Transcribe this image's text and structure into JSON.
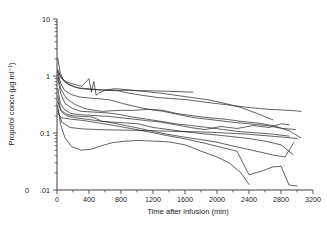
{
  "figure": {
    "background": "#ffffff",
    "line_color": "#262626",
    "axis_color": "#2b2b2b"
  },
  "chart_data": {
    "type": "line",
    "title": "",
    "subtitle": "",
    "xlabel": "Time after infusion (min)",
    "ylabel": "Propofol concn (µg ml⁻¹)",
    "xlim": [
      0,
      3200
    ],
    "ylim": [
      0.01,
      10
    ],
    "yscale": "log",
    "xscale": "linear",
    "grid": false,
    "legend": "none",
    "xticks": [
      0,
      400,
      800,
      1200,
      1600,
      2000,
      2400,
      2800,
      3200
    ],
    "xtick_labels": [
      "0",
      "400",
      "800",
      "1200",
      "1600",
      "2000",
      "2400",
      "2800",
      "3200"
    ],
    "x_minor_tick_interval": 200,
    "yticks": [
      0.01,
      0.1,
      1,
      10
    ],
    "ytick_labels": [
      ".01",
      "0.1",
      "1",
      "10"
    ],
    "axis_break_label": "0",
    "annotations": [
      "Axis break marker '0' shown left of the .01 tick on the ordinate"
    ],
    "series": [
      {
        "name": "Patient 1",
        "x": [
          10,
          40,
          80,
          130,
          200,
          300,
          420,
          520,
          640,
          760,
          900,
          1050,
          1200,
          1380,
          1560,
          1700
        ],
        "y": [
          2.05,
          1.15,
          0.85,
          0.72,
          0.66,
          0.6,
          0.58,
          0.57,
          0.57,
          0.56,
          0.56,
          0.55,
          0.55,
          0.54,
          0.53,
          0.52
        ]
      },
      {
        "name": "Patient 2",
        "x": [
          10,
          45,
          90,
          160,
          250,
          380,
          500,
          620,
          760,
          900,
          1060,
          1250,
          1450,
          1650,
          1900,
          2150,
          2400,
          2650,
          2900,
          3050
        ],
        "y": [
          1.3,
          1.0,
          0.82,
          0.7,
          0.62,
          0.6,
          0.58,
          0.56,
          0.55,
          0.5,
          0.46,
          0.42,
          0.4,
          0.38,
          0.34,
          0.31,
          0.28,
          0.26,
          0.25,
          0.24
        ]
      },
      {
        "name": "Patient 3",
        "x": [
          10,
          50,
          110,
          200,
          310,
          400,
          430,
          460,
          490,
          520,
          600,
          720,
          840,
          960,
          1120,
          1300,
          1480,
          1680,
          1900,
          2100,
          2300,
          2500,
          2700
        ],
        "y": [
          1.22,
          0.92,
          0.8,
          0.72,
          0.66,
          0.9,
          0.52,
          0.8,
          0.46,
          0.5,
          0.56,
          0.6,
          0.58,
          0.56,
          0.53,
          0.5,
          0.46,
          0.42,
          0.38,
          0.33,
          0.28,
          0.22,
          0.17
        ]
      },
      {
        "name": "Patient 4",
        "x": [
          10,
          45,
          95,
          180,
          280,
          400,
          520,
          660,
          820,
          980,
          1150,
          1330,
          1520,
          1720,
          1950,
          2180,
          2400,
          2620,
          2820,
          2980
        ],
        "y": [
          1.18,
          0.75,
          0.56,
          0.47,
          0.43,
          0.41,
          0.4,
          0.38,
          0.33,
          0.29,
          0.26,
          0.24,
          0.21,
          0.185,
          0.17,
          0.155,
          0.145,
          0.135,
          0.12,
          0.115
        ]
      },
      {
        "name": "Patient 5",
        "x": [
          10,
          50,
          120,
          220,
          340,
          470,
          560,
          680,
          820,
          980,
          1140,
          1320,
          1500,
          1700,
          1900,
          2100,
          2300,
          2500,
          2700,
          2900,
          3050
        ],
        "y": [
          1.05,
          0.58,
          0.4,
          0.32,
          0.27,
          0.25,
          0.24,
          0.245,
          0.25,
          0.25,
          0.26,
          0.25,
          0.22,
          0.2,
          0.185,
          0.175,
          0.16,
          0.15,
          0.135,
          0.11,
          0.082
        ]
      },
      {
        "name": "Patient 6",
        "x": [
          10,
          45,
          100,
          190,
          300,
          420,
          520,
          640,
          790,
          950,
          1120,
          1300,
          1480,
          1680,
          1880,
          2080,
          2300,
          2520,
          2720,
          2900
        ],
        "y": [
          0.92,
          0.5,
          0.33,
          0.27,
          0.24,
          0.235,
          0.23,
          0.225,
          0.21,
          0.19,
          0.175,
          0.16,
          0.145,
          0.135,
          0.125,
          0.115,
          0.105,
          0.1,
          0.095,
          0.088
        ]
      },
      {
        "name": "Patient 7",
        "x": [
          10,
          40,
          90,
          170,
          280,
          400,
          520,
          660,
          800,
          960,
          1120,
          1300,
          1480,
          1660,
          1850,
          2050,
          2250,
          2450,
          2650,
          2800,
          2900
        ],
        "y": [
          0.6,
          0.34,
          0.26,
          0.22,
          0.21,
          0.205,
          0.2,
          0.195,
          0.185,
          0.175,
          0.165,
          0.155,
          0.14,
          0.125,
          0.115,
          0.13,
          0.12,
          0.135,
          0.125,
          0.145,
          0.14
        ]
      },
      {
        "name": "Patient 8",
        "x": [
          10,
          45,
          110,
          200,
          320,
          450,
          560,
          700,
          860,
          1020,
          1200,
          1400,
          1600,
          1800,
          2000,
          2200,
          2400,
          2600,
          2800,
          2950
        ],
        "y": [
          0.45,
          0.26,
          0.215,
          0.2,
          0.195,
          0.19,
          0.16,
          0.155,
          0.15,
          0.145,
          0.125,
          0.115,
          0.105,
          0.098,
          0.092,
          0.086,
          0.08,
          0.072,
          0.062,
          0.042
        ]
      },
      {
        "name": "Patient 9",
        "x": [
          10,
          50,
          120,
          230,
          360,
          500,
          640,
          800,
          980,
          1160,
          1360,
          1560,
          1760,
          1980,
          2180,
          2380,
          2550,
          2700,
          2850,
          2960
        ],
        "y": [
          0.36,
          0.24,
          0.2,
          0.185,
          0.175,
          0.165,
          0.155,
          0.14,
          0.125,
          0.11,
          0.096,
          0.086,
          0.078,
          0.07,
          0.06,
          0.052,
          0.046,
          0.041,
          0.038,
          0.068
        ]
      },
      {
        "name": "Patient 10",
        "x": [
          10,
          45,
          100,
          180,
          300,
          430,
          560,
          700,
          860,
          1020,
          1200,
          1400,
          1600,
          1800,
          2000,
          2150,
          2300,
          2400
        ],
        "y": [
          0.3,
          0.14,
          0.082,
          0.058,
          0.05,
          0.052,
          0.06,
          0.068,
          0.072,
          0.074,
          0.072,
          0.07,
          0.062,
          0.048,
          0.038,
          0.03,
          0.02,
          0.0125
        ]
      },
      {
        "name": "Patient 11",
        "x": [
          10,
          60,
          160,
          320,
          500,
          700,
          900,
          1120,
          1350,
          1600,
          1850,
          2100,
          2350,
          2600,
          2850,
          3000
        ],
        "y": [
          0.25,
          0.155,
          0.125,
          0.118,
          0.115,
          0.113,
          0.112,
          0.11,
          0.108,
          0.106,
          0.104,
          0.1,
          0.096,
          0.09,
          0.084,
          0.08
        ]
      },
      {
        "name": "Patient 12",
        "x": [
          10,
          60,
          170,
          340,
          520,
          720,
          920,
          1140,
          1380,
          1620,
          1850,
          2050,
          2250,
          2400,
          2560,
          2700,
          2800,
          2900,
          3000
        ],
        "y": [
          0.22,
          0.185,
          0.175,
          0.165,
          0.15,
          0.135,
          0.12,
          0.105,
          0.09,
          0.078,
          0.066,
          0.056,
          0.048,
          0.0185,
          0.0215,
          0.0255,
          0.026,
          0.0122,
          0.0118
        ]
      }
    ]
  }
}
